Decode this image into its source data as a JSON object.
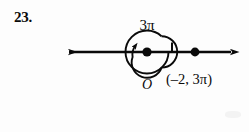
{
  "problem": {
    "number": "23."
  },
  "diagram": {
    "type": "polar-coordinate-plot",
    "angle_label": {
      "coefficient": "3",
      "symbol": "π",
      "full": "3π"
    },
    "origin_label": "O",
    "point_label": {
      "full": "(–2, 3π)",
      "open_paren": "(",
      "r_value": "–2",
      "separator": ", ",
      "theta_coefficient": "3",
      "theta_symbol": "π",
      "close_paren": ")"
    },
    "axis": {
      "name": "polar-axis",
      "orientation": "horizontal",
      "left_arrow": true,
      "right_arrow": true,
      "start_x": 60,
      "end_x": 238,
      "y": 52
    },
    "origin_point": {
      "x": 147,
      "y": 52
    },
    "plotted_point": {
      "x": 195,
      "y": 52
    },
    "tick_mark": {
      "x": 172,
      "y": 52
    },
    "spiral": {
      "center_x": 147,
      "center_y": 52,
      "turns": "1.5",
      "direction": "counterclockwise",
      "has_arrowhead": true
    },
    "colors": {
      "ink": "#0a0a0a",
      "background": "#fdfdfd"
    }
  }
}
